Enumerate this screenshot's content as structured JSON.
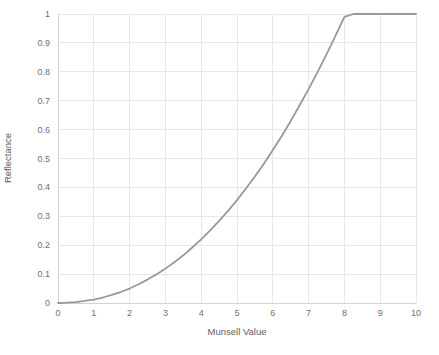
{
  "chart_data": {
    "type": "line",
    "title": "",
    "subtitle": "",
    "xlabel": "Munsell Value",
    "ylabel": "Reflectance",
    "xlim": [
      0,
      10
    ],
    "ylim": [
      0,
      1
    ],
    "grid": true,
    "legend": false,
    "legend_position": "none",
    "xticks": [
      "0",
      "1",
      "2",
      "3",
      "4",
      "5",
      "6",
      "7",
      "8",
      "9",
      "10"
    ],
    "yticks": [
      "0",
      "0.1",
      "0.2",
      "0.3",
      "0.4",
      "0.5",
      "0.6",
      "0.7",
      "0.8",
      "0.9",
      "1"
    ],
    "series": [
      {
        "name": "Reflectance",
        "color": "#999999",
        "line_width": 1.8,
        "x": [
          0,
          0.25,
          0.5,
          0.75,
          1,
          1.25,
          1.5,
          1.75,
          2,
          2.25,
          2.5,
          2.75,
          3,
          3.25,
          3.5,
          3.75,
          4,
          4.25,
          4.5,
          4.75,
          5,
          5.25,
          5.5,
          5.75,
          6,
          6.25,
          6.5,
          6.75,
          7,
          7.25,
          7.5,
          7.75,
          8,
          8.25,
          8.5,
          8.75,
          9,
          9.25,
          9.5,
          9.75,
          10
        ],
        "y": [
          0.0,
          0.001,
          0.003,
          0.007,
          0.012,
          0.019,
          0.028,
          0.038,
          0.05,
          0.065,
          0.081,
          0.099,
          0.119,
          0.141,
          0.165,
          0.192,
          0.22,
          0.251,
          0.284,
          0.319,
          0.356,
          0.396,
          0.438,
          0.482,
          0.529,
          0.578,
          0.63,
          0.684,
          0.74,
          0.799,
          0.86,
          0.924,
          0.99,
          1.059,
          1.13,
          1.204,
          1.28,
          1.359,
          1.44,
          1.524,
          1.61
        ]
      }
    ]
  },
  "style": {
    "background": "#ffffff",
    "grid_color": "#e7e7e7",
    "axis_color": "#d2d2d2",
    "tick_label_color": "#6f6f6f",
    "axis_title_color": "#5d5d5d",
    "curve_color": "#999999"
  }
}
